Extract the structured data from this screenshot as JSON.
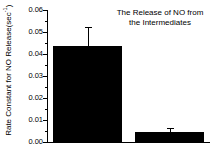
{
  "chart_data": {
    "type": "bar",
    "title_lines": [
      "The Release of NO from",
      "the Intermediates"
    ],
    "xlabel": "",
    "ylabel": "Rate Constant for NO Release(sec",
    "ylabel_superscript": "-1",
    "ylabel_suffix": ")",
    "categories": [
      "T-state",
      "R-state"
    ],
    "values": [
      0.0435,
      0.0045
    ],
    "errors": [
      0.009,
      0.002
    ],
    "ylim": [
      0.0,
      0.06
    ],
    "ytick_labels": [
      "0.00",
      "0.01",
      "0.02",
      "0.03",
      "0.04",
      "0.05",
      "0.06"
    ],
    "ytick_values": [
      0.0,
      0.01,
      0.02,
      0.03,
      0.04,
      0.05,
      0.06
    ],
    "yminor_values": [
      0.005,
      0.015,
      0.025,
      0.035,
      0.045,
      0.055
    ],
    "grid": false,
    "legend": false,
    "bar_color": "#000000",
    "axis_color": "#000000",
    "background_color": "#ffffff"
  }
}
